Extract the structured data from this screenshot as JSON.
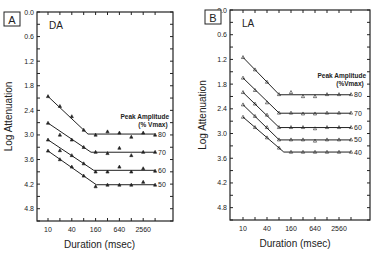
{
  "chart_data": [
    {
      "type": "line",
      "panel_label": "A",
      "title": "DA",
      "xlabel": "Duration (msec)",
      "ylabel": "Log Attenuation",
      "x_scale": "log2",
      "x_ticks": [
        10,
        40,
        160,
        640,
        2560
      ],
      "x_minor_ticks": [
        10,
        20,
        40,
        80,
        160,
        320,
        640,
        1280,
        2560,
        5120
      ],
      "y_ticks": [
        0.0,
        0.6,
        1.2,
        1.8,
        2.4,
        3.0,
        3.6,
        4.2,
        4.8
      ],
      "y_inverted": true,
      "ylim": [
        0.0,
        5.1
      ],
      "legend_title": "Peak Amplitude (% Vmax)",
      "x": [
        10,
        20,
        40,
        80,
        160,
        320,
        640,
        1280,
        2560,
        5120
      ],
      "series": [
        {
          "name": "80",
          "values": [
            2.06,
            2.3,
            2.55,
            2.88,
            3.0,
            2.92,
            2.95,
            3.05,
            2.95,
            3.0
          ]
        },
        {
          "name": "70",
          "values": [
            2.71,
            3.0,
            3.12,
            3.3,
            3.42,
            3.45,
            3.32,
            3.5,
            3.42,
            3.42
          ]
        },
        {
          "name": "60",
          "values": [
            3.12,
            3.38,
            3.5,
            3.7,
            3.9,
            3.9,
            3.78,
            3.9,
            3.82,
            3.88
          ]
        },
        {
          "name": "50",
          "values": [
            3.39,
            3.6,
            3.78,
            4.0,
            4.26,
            4.22,
            4.22,
            4.22,
            4.15,
            4.22
          ]
        }
      ]
    },
    {
      "type": "line",
      "panel_label": "B",
      "title": "LA",
      "xlabel": "Duration (msec)",
      "ylabel": "Log Attenuation",
      "x_scale": "log2",
      "x_ticks": [
        10,
        40,
        160,
        640,
        2560
      ],
      "x_minor_ticks": [
        10,
        20,
        40,
        80,
        160,
        320,
        640,
        1280,
        2560,
        5120
      ],
      "y_ticks": [
        0.0,
        0.6,
        1.2,
        1.8,
        2.4,
        3.0,
        3.6,
        4.2,
        4.8
      ],
      "y_inverted": true,
      "ylim": [
        0.0,
        5.1
      ],
      "legend_title": "Peak Amplitude (% Vmax)",
      "x": [
        10,
        20,
        40,
        80,
        160,
        320,
        640,
        1280,
        2560,
        5120
      ],
      "series": [
        {
          "name": "80",
          "values": [
            1.15,
            1.45,
            1.75,
            2.05,
            2.0,
            2.1,
            2.1,
            2.05,
            2.05,
            2.05
          ]
        },
        {
          "name": "70",
          "values": [
            1.65,
            1.95,
            2.25,
            2.5,
            2.5,
            2.52,
            2.52,
            2.5,
            2.5,
            2.5
          ]
        },
        {
          "name": "60",
          "values": [
            2.0,
            2.28,
            2.55,
            2.85,
            2.85,
            2.85,
            2.88,
            2.85,
            2.85,
            2.85
          ]
        },
        {
          "name": "50",
          "values": [
            2.3,
            2.58,
            2.85,
            3.15,
            3.15,
            3.15,
            3.18,
            3.15,
            3.15,
            3.15
          ]
        },
        {
          "name": "40",
          "values": [
            2.6,
            2.85,
            3.1,
            3.35,
            3.45,
            3.45,
            3.45,
            3.45,
            3.45,
            3.45
          ]
        }
      ]
    }
  ],
  "labels": {
    "panelA": {
      "letter": "A",
      "title": "DA",
      "legend1": "Peak Amplitude",
      "legend2": "(% Vmax)"
    },
    "panelB": {
      "letter": "B",
      "title": "LA",
      "legend1": "Peak Amplitude",
      "legend2": "(%Vmax)"
    },
    "xlabel": "Duration (msec)",
    "ylabel": "Log Attenuation"
  }
}
